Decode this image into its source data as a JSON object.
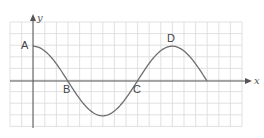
{
  "diagram": {
    "type": "sine-wave-on-grid",
    "axes": {
      "x_label": "x",
      "y_label": "y"
    },
    "grid": {
      "columns": 20,
      "rows": 9,
      "color": "#d9d9d9"
    },
    "curve": {
      "shape": "cosine",
      "color": "#6e6e6e",
      "amplitude_cells": 3,
      "period_cells": 12,
      "span_cells": 15
    },
    "points": [
      {
        "id": "A",
        "label": "A",
        "description": "maximum on y-axis"
      },
      {
        "id": "B",
        "label": "B",
        "description": "first x-intercept"
      },
      {
        "id": "C",
        "label": "C",
        "description": "second x-intercept"
      },
      {
        "id": "D",
        "label": "D",
        "description": "second maximum"
      }
    ]
  }
}
